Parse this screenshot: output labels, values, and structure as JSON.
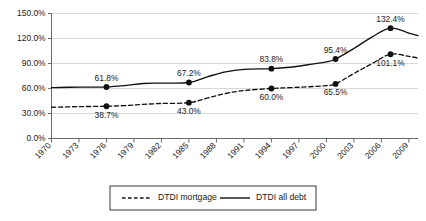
{
  "chart_data": {
    "type": "line",
    "title": "",
    "xlabel": "",
    "ylabel": "",
    "xlim": [
      1970,
      2010
    ],
    "ylim": [
      0,
      150
    ],
    "y_tick_labels": [
      "0.0%",
      "30.0%",
      "60.0%",
      "90.0%",
      "120.0%",
      "150.0%"
    ],
    "y_tick_values": [
      0,
      30,
      60,
      90,
      120,
      150
    ],
    "x_tick_labels": [
      "1970",
      "1973",
      "1976",
      "1979",
      "1982",
      "1985",
      "1988",
      "1991",
      "1994",
      "1997",
      "2000",
      "2003",
      "2006",
      "2009"
    ],
    "x_tick_values": [
      1970,
      1973,
      1976,
      1979,
      1982,
      1985,
      1988,
      1991,
      1994,
      1997,
      2000,
      2003,
      2006,
      2009
    ],
    "grid": "horizontal",
    "legend_position": "bottom",
    "series": [
      {
        "name": "DTDI mortgage",
        "style": "dashed",
        "color": "#111111",
        "x": [
          1970,
          1972,
          1974,
          1976,
          1978,
          1980,
          1982,
          1985,
          1987,
          1989,
          1991,
          1994,
          1996,
          1998,
          2000,
          2001,
          2003,
          2005,
          2007,
          2009,
          2010
        ],
        "values": [
          37.5,
          38.0,
          38.4,
          38.7,
          39.5,
          41.0,
          42.0,
          43.0,
          48.5,
          54.0,
          57.5,
          60.0,
          61.0,
          62.0,
          63.5,
          65.5,
          78.0,
          90.0,
          101.1,
          98.5,
          96.5
        ]
      },
      {
        "name": "DTDI all debt",
        "style": "solid",
        "color": "#111111",
        "x": [
          1970,
          1972,
          1974,
          1976,
          1978,
          1980,
          1982,
          1985,
          1987,
          1989,
          1991,
          1994,
          1996,
          1998,
          2000,
          2001,
          2003,
          2005,
          2007,
          2009,
          2010
        ],
        "values": [
          61.0,
          61.5,
          61.6,
          61.8,
          63.5,
          66.0,
          66.5,
          67.2,
          74.0,
          80.0,
          83.0,
          83.8,
          85.5,
          88.5,
          92.0,
          95.4,
          108.0,
          122.0,
          132.4,
          126.5,
          123.5
        ]
      }
    ],
    "point_labels": [
      {
        "series": "DTDI all debt",
        "x": 1976,
        "y": 61.8,
        "text": "61.8%",
        "anchor": "above"
      },
      {
        "series": "DTDI all debt",
        "x": 1985,
        "y": 67.2,
        "text": "67.2%",
        "anchor": "above"
      },
      {
        "series": "DTDI all debt",
        "x": 1994,
        "y": 83.8,
        "text": "83.8%",
        "anchor": "above"
      },
      {
        "series": "DTDI all debt",
        "x": 2001,
        "y": 95.4,
        "text": "95.4%",
        "anchor": "above"
      },
      {
        "series": "DTDI all debt",
        "x": 2007,
        "y": 132.4,
        "text": "132.4%",
        "anchor": "above"
      },
      {
        "series": "DTDI mortgage",
        "x": 1976,
        "y": 38.7,
        "text": "38.7%",
        "anchor": "below"
      },
      {
        "series": "DTDI mortgage",
        "x": 1985,
        "y": 43.0,
        "text": "43.0%",
        "anchor": "below"
      },
      {
        "series": "DTDI mortgage",
        "x": 1994,
        "y": 60.0,
        "text": "60.0%",
        "anchor": "below"
      },
      {
        "series": "DTDI mortgage",
        "x": 2001,
        "y": 65.5,
        "text": "65.5%",
        "anchor": "below"
      },
      {
        "series": "DTDI mortgage",
        "x": 2007,
        "y": 101.1,
        "text": "101.1%",
        "anchor": "below"
      }
    ],
    "markers": [
      {
        "series": "DTDI all debt",
        "x": 1976,
        "y": 61.8
      },
      {
        "series": "DTDI all debt",
        "x": 1985,
        "y": 67.2
      },
      {
        "series": "DTDI all debt",
        "x": 1994,
        "y": 83.8
      },
      {
        "series": "DTDI all debt",
        "x": 2001,
        "y": 95.4
      },
      {
        "series": "DTDI all debt",
        "x": 2007,
        "y": 132.4
      },
      {
        "series": "DTDI mortgage",
        "x": 1976,
        "y": 38.7
      },
      {
        "series": "DTDI mortgage",
        "x": 1985,
        "y": 43.0
      },
      {
        "series": "DTDI mortgage",
        "x": 1994,
        "y": 60.0
      },
      {
        "series": "DTDI mortgage",
        "x": 2001,
        "y": 65.5
      },
      {
        "series": "DTDI mortgage",
        "x": 2007,
        "y": 101.1
      }
    ],
    "legend": [
      {
        "label": "DTDI mortgage",
        "style": "dashed"
      },
      {
        "label": "DTDI all debt",
        "style": "solid"
      }
    ],
    "colors": {
      "series": "#111111",
      "grid": "#c9c9c9",
      "axis": "#5a5a5a",
      "background": "#ffffff"
    }
  }
}
